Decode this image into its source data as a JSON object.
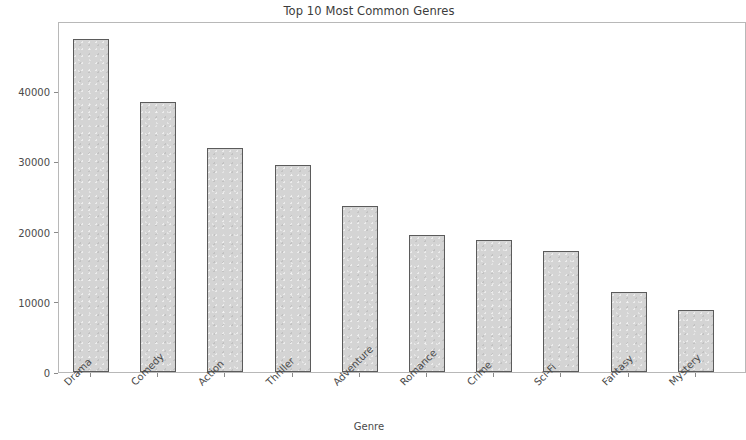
{
  "chart_data": {
    "type": "bar",
    "title": "Top 10 Most Common Genres",
    "xlabel": "Genre",
    "ylabel": "Number of Movies",
    "categories": [
      "Drama",
      "Comedy",
      "Action",
      "Thriller",
      "Adventure",
      "Romance",
      "Crime",
      "Sci-Fi",
      "Fantasy",
      "Mystery"
    ],
    "values": [
      47400,
      38400,
      31900,
      29500,
      23600,
      19500,
      18800,
      17200,
      11400,
      8800
    ],
    "ylim": [
      0,
      50000
    ],
    "yticks": [
      0,
      10000,
      20000,
      30000,
      40000
    ],
    "ytick_labels": [
      "0",
      "10000",
      "20000",
      "30000",
      "40000"
    ],
    "grid": false,
    "legend": null,
    "bar_color": "#d4d4d4",
    "bar_edge_color": "#5b5b5b",
    "axis_color": "#b8b8b8",
    "text_color": "#4a4a4a"
  }
}
